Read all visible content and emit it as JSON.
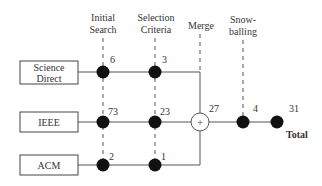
{
  "columns": [
    {
      "id": "initial-search",
      "line1": "Initial",
      "line2": "Search"
    },
    {
      "id": "selection-criteria",
      "line1": "Selection",
      "line2": "Criteria"
    },
    {
      "id": "merge",
      "line1": "Merge",
      "line2": ""
    },
    {
      "id": "snowballing",
      "line1": "Snow-",
      "line2": "balling"
    }
  ],
  "sources": [
    {
      "id": "science-direct",
      "line1": "Science",
      "line2": "Direct",
      "initial": "6",
      "selected": "3"
    },
    {
      "id": "ieee",
      "line1": "IEEE",
      "line2": "",
      "initial": "73",
      "selected": "23"
    },
    {
      "id": "acm",
      "line1": "ACM",
      "line2": "",
      "initial": "2",
      "selected": "1"
    }
  ],
  "merge": {
    "symbol": "+",
    "value": "27"
  },
  "snowballing": {
    "added": "4"
  },
  "total": {
    "value": "31",
    "label": "Total"
  },
  "colors": {
    "line": "#555555",
    "node": "#111111",
    "box_border": "#444444",
    "text": "#333333"
  }
}
